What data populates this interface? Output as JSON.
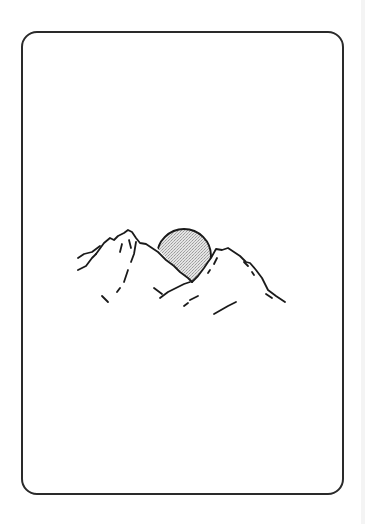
{
  "card": {
    "border_color": "#2a2a2a",
    "background": "#ffffff",
    "corner_radius": 16
  },
  "illustration": {
    "subject": "mountains-with-sun",
    "sun": {
      "center": [
        184,
        256
      ],
      "radius": 27,
      "fill": "#d6d6d6",
      "stroke": "#1a1a1a"
    },
    "stroke_color": "#1a1a1a"
  },
  "edge_strip": {
    "color": "#f4f4f4"
  }
}
